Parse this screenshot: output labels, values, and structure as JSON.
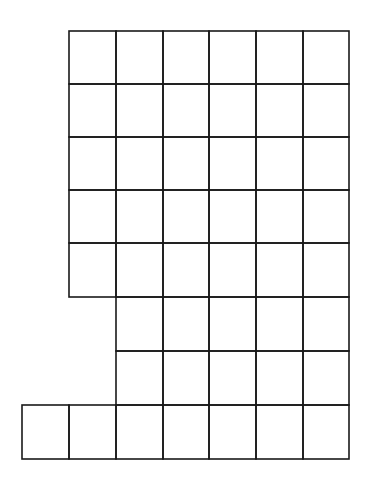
{
  "figure": {
    "cell_count": 47,
    "line_color": "#1a1a1a",
    "background": "#ffffff",
    "columns_x": [
      22,
      69,
      116,
      163,
      209,
      256,
      303,
      349
    ],
    "rows_y": [
      31,
      84,
      137,
      190,
      243,
      297,
      351,
      405,
      459
    ],
    "rows": [
      {
        "row": 0,
        "start_col": 1,
        "end_col": 6,
        "cells": 6
      },
      {
        "row": 1,
        "start_col": 1,
        "end_col": 6,
        "cells": 6
      },
      {
        "row": 2,
        "start_col": 1,
        "end_col": 6,
        "cells": 6
      },
      {
        "row": 3,
        "start_col": 1,
        "end_col": 6,
        "cells": 6
      },
      {
        "row": 4,
        "start_col": 1,
        "end_col": 6,
        "cells": 6
      },
      {
        "row": 5,
        "start_col": 2,
        "end_col": 6,
        "cells": 5
      },
      {
        "row": 6,
        "start_col": 2,
        "end_col": 6,
        "cells": 5
      },
      {
        "row": 7,
        "start_col": 0,
        "end_col": 6,
        "cells": 7
      }
    ]
  }
}
